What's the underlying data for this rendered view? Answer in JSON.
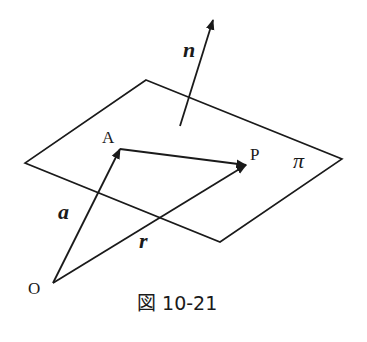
{
  "diagram": {
    "caption": "図 10-21",
    "plane_label": "π",
    "points": {
      "origin": "O",
      "a_point": "A",
      "p_point": "P"
    },
    "vectors": {
      "normal": "n",
      "a": "a",
      "r": "r"
    },
    "colors": {
      "stroke": "#1a1a1a",
      "background": "#ffffff"
    }
  }
}
